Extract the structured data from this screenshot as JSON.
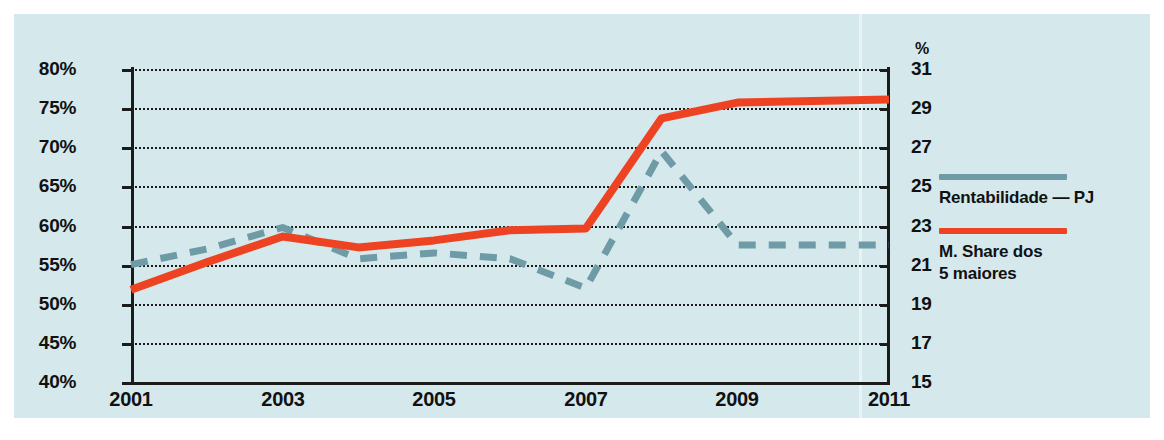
{
  "chart_data": {
    "type": "line",
    "title": "",
    "xlabel": "",
    "ylabel": "",
    "grid": true,
    "legend_position": "right",
    "x": [
      2001,
      2002,
      2003,
      2004,
      2005,
      2006,
      2007,
      2008,
      2009,
      2010,
      2011
    ],
    "x_tick_labels": [
      "2001",
      "2003",
      "2005",
      "2007",
      "2009",
      "2011"
    ],
    "x_ticks": [
      2001,
      2003,
      2005,
      2007,
      2009,
      2011
    ],
    "axes": {
      "left": {
        "tick_labels": [
          "80%",
          "75%",
          "70%",
          "65%",
          "60%",
          "55%",
          "50%",
          "45%",
          "40%"
        ],
        "ticks": [
          80,
          75,
          70,
          65,
          60,
          55,
          50,
          45,
          40
        ],
        "ylim": [
          40,
          80
        ],
        "unit": "%"
      },
      "right": {
        "header": "%",
        "tick_labels": [
          "31",
          "29",
          "27",
          "25",
          "23",
          "21",
          "19",
          "17",
          "15"
        ],
        "ticks": [
          31,
          29,
          27,
          25,
          23,
          21,
          19,
          17,
          15
        ],
        "ylim": [
          15,
          31
        ],
        "unit": "%"
      }
    },
    "series": [
      {
        "name": "Rentabilidade — PJ",
        "axis": "right",
        "color": "#6f9ba6",
        "style": "dashed",
        "values": [
          21.0,
          21.8,
          22.9,
          21.3,
          21.6,
          21.3,
          19.8,
          26.8,
          22.0,
          22.0,
          22.0
        ]
      },
      {
        "name": "M. Share dos 5 maiores",
        "axis": "left",
        "color": "#ee4323",
        "style": "solid",
        "values": [
          51.8,
          55.3,
          58.6,
          57.2,
          58.1,
          59.4,
          59.6,
          73.7,
          75.7,
          75.9,
          76.1
        ]
      }
    ]
  },
  "legend": {
    "items": [
      {
        "label": "Rentabilidade — PJ",
        "color": "#6f9ba6",
        "swatch": "teal-line-swatch"
      },
      {
        "label": "M. Share dos\n5 maiores",
        "color": "#ee4323",
        "swatch": "red-line-swatch"
      }
    ],
    "item1_label": "Rentabilidade — PJ",
    "item2_label_line1": "M. Share dos",
    "item2_label_line2": "5 maiores"
  },
  "colors": {
    "background": "#d5e9ec",
    "page": "#ffffff",
    "teal": "#6f9ba6",
    "red": "#ee4323",
    "ink": "#111111"
  },
  "right_axis_header": "%"
}
